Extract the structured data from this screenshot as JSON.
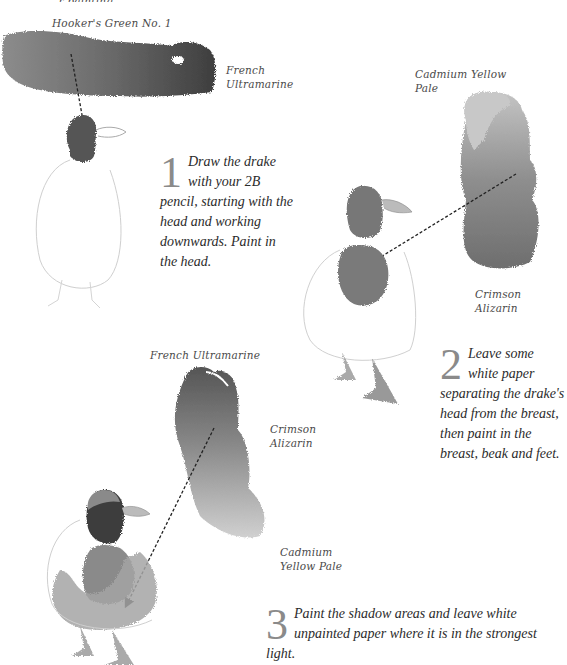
{
  "header": {
    "cut_off_text": "...r painting"
  },
  "swatches": {
    "top": {
      "labels": [
        "Hooker's Green No. 1",
        "French Ultramarine"
      ]
    },
    "right": {
      "labels": [
        "Cadmium Yellow Pale",
        "Crimson Alizarin"
      ]
    },
    "bottom": {
      "labels": [
        "French Ultramarine",
        "Crimson Alizarin",
        "Cadmium Yellow Pale"
      ]
    }
  },
  "labels": {
    "hookers_green": "Hooker's Green No. 1",
    "french_ultramarine_1a": "French",
    "french_ultramarine_1b": "Ultramarine",
    "cadmium_yellow_2a": "Cadmium Yellow",
    "cadmium_yellow_2b": "Pale",
    "crimson_alizarin_2": "Crimson Alizarin",
    "french_ultramarine_3": "French Ultramarine",
    "crimson_alizarin_3a": "Crimson",
    "crimson_alizarin_3b": "Alizarin",
    "cadmium_yellow_3a": "Cadmium",
    "cadmium_yellow_3b": "Yellow Pale"
  },
  "steps": [
    {
      "number": "1",
      "text": "Draw the drake with your 2B pencil, starting with the head and working downwards. Paint in the head."
    },
    {
      "number": "2",
      "text": "Leave some white paper separating the drake's head from the breast, then paint in the breast, beak and feet."
    },
    {
      "number": "3",
      "text": "Paint the shadow areas and leave white unpainted paper where it is in the strongest light."
    }
  ],
  "colors": {
    "paper": "#ffffff",
    "wash_dark": "#4a4a4a",
    "wash_mid": "#7d7d7d",
    "wash_light": "#b5b5b5",
    "pencil": "#c8c8c8",
    "numeral": "#8a8a8a"
  }
}
